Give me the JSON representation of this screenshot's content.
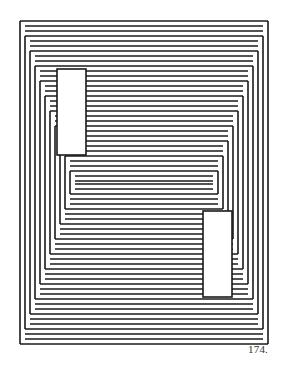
{
  "artwork": {
    "description": "Nested stepped line structure with two inset rectangles",
    "stroke_color": "#1a1a1a",
    "background": "#ffffff",
    "stroke_width": 1.6,
    "outer_frame": {
      "left": 20,
      "top": 21,
      "right": 268,
      "bottom": 344
    },
    "line_spacing": 5,
    "frame_count": 11,
    "band_step": 15,
    "rectangles": [
      {
        "name": "upper-left-rectangle",
        "x": 57,
        "y": 69,
        "width": 29,
        "height": 86
      },
      {
        "name": "lower-right-rectangle",
        "x": 203,
        "y": 211,
        "width": 29,
        "height": 86
      }
    ]
  },
  "plate_number": "174."
}
